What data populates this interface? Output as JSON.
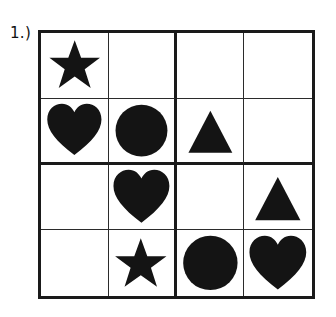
{
  "page": {
    "background_color": "#ffffff",
    "ink_color": "#141414",
    "grid_line_color": "#2b2b2b",
    "grid_border_color": "#1a1a1a"
  },
  "problem": {
    "label": "1.)"
  },
  "puzzle": {
    "type": "shape-sudoku",
    "rows": 4,
    "columns": 4,
    "block_rows": 2,
    "block_columns": 2,
    "shape_symbols": [
      "star",
      "heart",
      "circle",
      "triangle"
    ],
    "cells": [
      [
        {
          "row": 1,
          "col": 1,
          "shape": "star",
          "name": "cell-r1c1"
        },
        {
          "row": 1,
          "col": 2,
          "shape": "",
          "name": "cell-r1c2"
        },
        {
          "row": 1,
          "col": 3,
          "shape": "",
          "name": "cell-r1c3"
        },
        {
          "row": 1,
          "col": 4,
          "shape": "",
          "name": "cell-r1c4"
        }
      ],
      [
        {
          "row": 2,
          "col": 1,
          "shape": "heart",
          "name": "cell-r2c1"
        },
        {
          "row": 2,
          "col": 2,
          "shape": "circle",
          "name": "cell-r2c2"
        },
        {
          "row": 2,
          "col": 3,
          "shape": "triangle",
          "name": "cell-r2c3"
        },
        {
          "row": 2,
          "col": 4,
          "shape": "",
          "name": "cell-r2c4"
        }
      ],
      [
        {
          "row": 3,
          "col": 1,
          "shape": "",
          "name": "cell-r3c1"
        },
        {
          "row": 3,
          "col": 2,
          "shape": "heart",
          "name": "cell-r3c2"
        },
        {
          "row": 3,
          "col": 3,
          "shape": "",
          "name": "cell-r3c3"
        },
        {
          "row": 3,
          "col": 4,
          "shape": "triangle",
          "name": "cell-r3c4"
        }
      ],
      [
        {
          "row": 4,
          "col": 1,
          "shape": "",
          "name": "cell-r4c1"
        },
        {
          "row": 4,
          "col": 2,
          "shape": "star",
          "name": "cell-r4c2"
        },
        {
          "row": 4,
          "col": 3,
          "shape": "circle",
          "name": "cell-r4c3"
        },
        {
          "row": 4,
          "col": 4,
          "shape": "heart",
          "name": "cell-r4c4"
        }
      ]
    ]
  }
}
